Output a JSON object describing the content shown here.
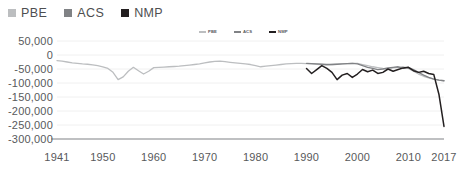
{
  "legend": {
    "entries": [
      {
        "label": "PBE",
        "color": "#bcbec0",
        "icon": "square-swatch"
      },
      {
        "label": "ACS",
        "color": "#808285",
        "icon": "square-swatch"
      },
      {
        "label": "NMP",
        "color": "#231f20",
        "icon": "square-swatch"
      }
    ]
  },
  "inner_legend": {
    "entries": [
      {
        "label": "PBE",
        "color": "#bcbec0",
        "icon": "line-swatch"
      },
      {
        "label": "ACS",
        "color": "#808285",
        "icon": "line-swatch"
      },
      {
        "label": "NMP",
        "color": "#231f20",
        "icon": "line-swatch"
      }
    ]
  },
  "chart_data": {
    "type": "line",
    "title": "",
    "subtitle": "",
    "xlabel": "",
    "ylabel": "",
    "grid": true,
    "legend_position": "top-left",
    "xlim": [
      1941,
      2017
    ],
    "ylim": [
      -300000,
      50000
    ],
    "ytick_labels": [
      "50,000",
      "0",
      "-50,000",
      "-100,000",
      "-150,000",
      "-200,000",
      "-250,000",
      "-300,000"
    ],
    "ytick_values": [
      50000,
      0,
      -50000,
      -100000,
      -150000,
      -200000,
      -250000,
      -300000
    ],
    "xtick_labels": [
      "1941",
      "1950",
      "1960",
      "1970",
      "1980",
      "1990",
      "2000",
      "2010",
      "2017"
    ],
    "xtick_values": [
      1941,
      1950,
      1960,
      1970,
      1980,
      1990,
      2000,
      2010,
      2017
    ],
    "series": [
      {
        "name": "PBE",
        "color": "#bcbec0",
        "x": [
          1941,
          1942,
          1943,
          1944,
          1945,
          1946,
          1947,
          1948,
          1949,
          1950,
          1951,
          1952,
          1953,
          1954,
          1955,
          1956,
          1957,
          1958,
          1959,
          1960,
          1961,
          1962,
          1963,
          1964,
          1965,
          1966,
          1967,
          1968,
          1969,
          1970,
          1971,
          1972,
          1973,
          1974,
          1975,
          1976,
          1977,
          1978,
          1979,
          1980,
          1981,
          1982,
          1983,
          1984,
          1985,
          1986,
          1987,
          1988,
          1989,
          1990,
          1991,
          1992,
          1993,
          1994,
          1995,
          1996,
          1997,
          1998,
          1999,
          2000,
          2001,
          2002,
          2003,
          2004,
          2005,
          2006,
          2007,
          2008,
          2009,
          2010,
          2011,
          2012,
          2013,
          2014,
          2015,
          2016,
          2017
        ],
        "values": [
          -20000,
          -22000,
          -25000,
          -28000,
          -30000,
          -32000,
          -33000,
          -35000,
          -38000,
          -42000,
          -48000,
          -62000,
          -88000,
          -78000,
          -58000,
          -44000,
          -56000,
          -68000,
          -58000,
          -45000,
          -44000,
          -43000,
          -42000,
          -41000,
          -40000,
          -38000,
          -36000,
          -34000,
          -32000,
          -28000,
          -25000,
          -23000,
          -22000,
          -24000,
          -26000,
          -28000,
          -30000,
          -32000,
          -34000,
          -38000,
          -42000,
          -40000,
          -38000,
          -36000,
          -34000,
          -32000,
          -31000,
          -30000,
          -30000,
          -31000,
          -32000,
          -33000,
          -34000,
          -35000,
          -34000,
          -33000,
          -32000,
          -31000,
          -30000,
          -30000,
          -34000,
          -38000,
          -42000,
          -45000,
          -48000,
          -50000,
          -46000,
          -44000,
          -42000,
          -48000,
          -58000,
          -68000,
          -76000,
          -82000,
          -86000,
          -90000,
          -92000
        ]
      },
      {
        "name": "ACS",
        "color": "#808285",
        "x": [
          1990,
          1991,
          1992,
          1993,
          1994,
          1995,
          1996,
          1997,
          1998,
          1999,
          2000,
          2001,
          2002,
          2003,
          2004,
          2005,
          2006,
          2007,
          2008,
          2009,
          2010,
          2011,
          2012,
          2013,
          2014,
          2015,
          2016,
          2017
        ],
        "values": [
          -30000,
          -31000,
          -32000,
          -33000,
          -34000,
          -34000,
          -33000,
          -32000,
          -31000,
          -30000,
          -32000,
          -38000,
          -44000,
          -48000,
          -52000,
          -50000,
          -46000,
          -44000,
          -42000,
          -48000,
          -44000,
          -52000,
          -62000,
          -72000,
          -80000,
          -86000,
          -90000,
          -92000
        ]
      },
      {
        "name": "NMP",
        "color": "#231f20",
        "x": [
          1990,
          1991,
          1992,
          1993,
          1994,
          1995,
          1996,
          1997,
          1998,
          1999,
          2000,
          2001,
          2002,
          2003,
          2004,
          2005,
          2006,
          2007,
          2008,
          2009,
          2010,
          2011,
          2012,
          2013,
          2014,
          2015,
          2016,
          2017
        ],
        "values": [
          -48000,
          -66000,
          -52000,
          -38000,
          -48000,
          -62000,
          -88000,
          -72000,
          -66000,
          -80000,
          -68000,
          -52000,
          -60000,
          -54000,
          -66000,
          -62000,
          -50000,
          -58000,
          -52000,
          -46000,
          -44000,
          -56000,
          -62000,
          -58000,
          -66000,
          -70000,
          -140000,
          -255000
        ]
      }
    ],
    "annotations": [
      "PBE trough near -90,000 around 1952-1953",
      "NMP series begins 1990",
      "NMP collapses sharply to approximately -255,000 by 2017"
    ]
  },
  "colors": {
    "pbe": "#bcbec0",
    "acs": "#808285",
    "nmp": "#231f20",
    "grid": "#f0f0f0",
    "axis": "#808285",
    "text": "#58595b"
  }
}
